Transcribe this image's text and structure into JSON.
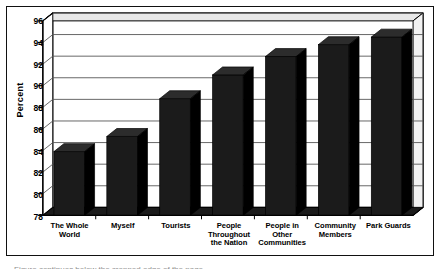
{
  "chart_data": {
    "type": "bar",
    "title": "",
    "xlabel": "",
    "ylabel": "Percent",
    "ylim": [
      78,
      96
    ],
    "ytick_step": 2,
    "yticks": [
      "96",
      "94",
      "92",
      "90",
      "88",
      "86",
      "84",
      "82",
      "80",
      "78"
    ],
    "grid": "horizontal",
    "legend": "none",
    "orientation": "vertical",
    "bar_style": "3d-black",
    "categories": [
      "The Whole World",
      "Myself",
      "Tourists",
      "People Throughout the Nation",
      "People in Other Communities",
      "Community Members",
      "Park Guards"
    ],
    "category_lines": [
      [
        "The Whole",
        "World"
      ],
      [
        "Myself"
      ],
      [
        "Tourists"
      ],
      [
        "People",
        "Throughout",
        "the Nation"
      ],
      [
        "People in",
        "Other",
        "Communities"
      ],
      [
        "Community",
        "Members"
      ],
      [
        "Park Guards"
      ]
    ],
    "values": [
      83.9,
      85.3,
      88.8,
      91.0,
      92.7,
      93.8,
      94.5
    ],
    "series": [
      {
        "name": "Percent",
        "values": [
          83.9,
          85.3,
          88.8,
          91.0,
          92.7,
          93.8,
          94.5
        ]
      }
    ],
    "colors": {
      "bar_fill": "#1b1b1b",
      "bar_side": "#000000",
      "bar_top": "#2c2c2c",
      "grid": "#555555",
      "axis": "#000000",
      "frame": "#111111",
      "plot_bg": "#ffffff",
      "text": "#000000"
    }
  },
  "caption": {
    "sliver_text": "Figure continues below the cropped edge of the page."
  }
}
